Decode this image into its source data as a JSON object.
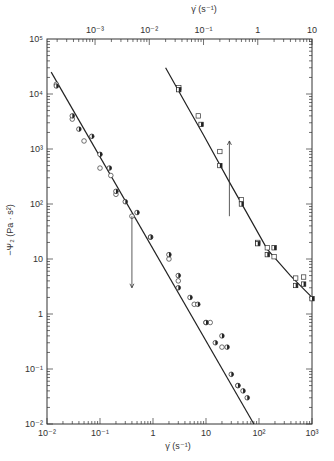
{
  "chart_data": {
    "type": "scatter",
    "title": "",
    "xlabel": "γ̇ (s⁻¹)",
    "x2label": "γ̇ (s⁻¹)",
    "ylabel": "−Ψ₂ (Pa · s²)",
    "xscale": "log",
    "yscale": "log",
    "xlim": [
      0.01,
      1000
    ],
    "x2lim": [
      0.00013,
      10
    ],
    "ylim": [
      0.01,
      100000
    ],
    "x_ticks": [
      "10⁻²",
      "10⁻¹",
      "1",
      "10",
      "10²",
      "10³"
    ],
    "x2_ticks": [
      "10⁻³",
      "10⁻²",
      "10⁻¹",
      "1",
      "10"
    ],
    "y_ticks": [
      "10⁻²",
      "10⁻¹",
      "1",
      "10",
      "10²",
      "10³",
      "10⁴",
      "10⁵"
    ],
    "grid": false,
    "series": [
      {
        "name": "Left data set (bottom axis)",
        "axis": "bottom",
        "fit_line": [
          [
            0.012,
            25000
          ],
          [
            80,
            0.01
          ]
        ],
        "points_open_circle": [
          [
            0.015,
            15000
          ],
          [
            0.03,
            3500
          ],
          [
            0.05,
            1400
          ],
          [
            0.1,
            450
          ],
          [
            0.16,
            330
          ],
          [
            0.2,
            150
          ],
          [
            0.4,
            60
          ],
          [
            0.9,
            25
          ],
          [
            2,
            10
          ],
          [
            3,
            4
          ],
          [
            6,
            1.5
          ],
          [
            10,
            0.7
          ],
          [
            12,
            0.7
          ],
          [
            20,
            0.25
          ],
          [
            40,
            0.05
          ]
        ],
        "points_half_filled": [
          [
            0.015,
            14000
          ],
          [
            0.03,
            4000
          ],
          [
            0.04,
            2300
          ],
          [
            0.07,
            1700
          ],
          [
            0.1,
            800
          ],
          [
            0.15,
            450
          ],
          [
            0.2,
            170
          ],
          [
            0.3,
            110
          ],
          [
            0.5,
            70
          ],
          [
            0.9,
            25
          ],
          [
            2,
            12
          ],
          [
            3,
            5
          ],
          [
            3,
            3
          ],
          [
            5,
            2
          ],
          [
            7,
            1.5
          ],
          [
            10,
            0.7
          ],
          [
            15,
            0.3
          ],
          [
            20,
            0.4
          ],
          [
            25,
            0.25
          ],
          [
            30,
            0.08
          ],
          [
            40,
            0.05
          ],
          [
            50,
            0.04
          ],
          [
            60,
            0.03
          ]
        ]
      },
      {
        "name": "Right data set (top axis)",
        "axis": "top",
        "fit_line": [
          [
            0.02,
            30000
          ],
          [
            10,
            2
          ]
        ],
        "points_open_square": [
          [
            0.035,
            13000
          ],
          [
            0.08,
            4000
          ],
          [
            0.2,
            900
          ],
          [
            0.5,
            120
          ],
          [
            1,
            20
          ],
          [
            1.5,
            16
          ],
          [
            2,
            11
          ],
          [
            5,
            4.5
          ],
          [
            7,
            4.7
          ]
        ],
        "points_half_square": [
          [
            0.035,
            12000
          ],
          [
            0.09,
            2800
          ],
          [
            0.2,
            500
          ],
          [
            0.5,
            100
          ],
          [
            1,
            19
          ],
          [
            1.5,
            12
          ],
          [
            2,
            16
          ],
          [
            5,
            3.3
          ],
          [
            7,
            3.5
          ],
          [
            10,
            1.9
          ]
        ]
      }
    ],
    "annotations": [
      {
        "type": "arrow",
        "direction": "down",
        "x": 0.4,
        "from_y": 60,
        "to_y": 3,
        "axis": "bottom"
      },
      {
        "type": "arrow",
        "direction": "up",
        "x": 0.3,
        "from_y": 60,
        "to_y": 1400,
        "axis": "top"
      }
    ]
  }
}
